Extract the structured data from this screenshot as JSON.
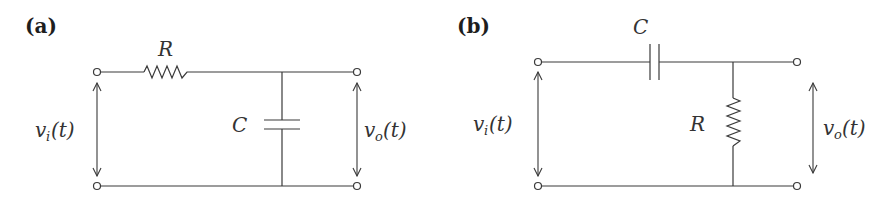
{
  "figure": {
    "panels": [
      {
        "id": "a",
        "label": "(a)",
        "type": "RC low-pass filter",
        "components": {
          "series": {
            "symbol": "R",
            "kind": "resistor"
          },
          "shunt": {
            "symbol": "C",
            "kind": "capacitor"
          }
        },
        "input_label": {
          "v": "v",
          "sub": "i",
          "arg": "(t)"
        },
        "output_label": {
          "v": "v",
          "sub": "o",
          "arg": "(t)"
        }
      },
      {
        "id": "b",
        "label": "(b)",
        "type": "RC high-pass filter",
        "components": {
          "series": {
            "symbol": "C",
            "kind": "capacitor"
          },
          "shunt": {
            "symbol": "R",
            "kind": "resistor"
          }
        },
        "input_label": {
          "v": "v",
          "sub": "i",
          "arg": "(t)"
        },
        "output_label": {
          "v": "v",
          "sub": "o",
          "arg": "(t)"
        }
      }
    ]
  }
}
